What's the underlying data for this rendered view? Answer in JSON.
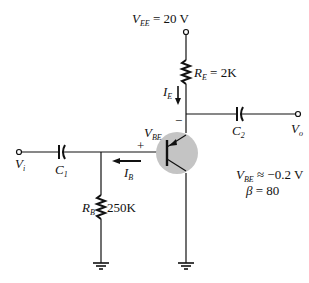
{
  "circuit": {
    "supply": {
      "symbol": "V",
      "sub": "EE",
      "value": "= 20 V"
    },
    "re": {
      "symbol": "R",
      "sub": "E",
      "value": "= 2K"
    },
    "ie": {
      "symbol": "I",
      "sub": "E"
    },
    "minus": "−",
    "plus": "+",
    "vbe_label": {
      "symbol": "V",
      "sub": "BE"
    },
    "c2": {
      "symbol": "C",
      "sub": "2"
    },
    "vo": {
      "symbol": "V",
      "sub": "o"
    },
    "vi": {
      "symbol": "V",
      "sub": "i"
    },
    "c1": {
      "symbol": "C",
      "sub": "1"
    },
    "ib": {
      "symbol": "I",
      "sub": "B"
    },
    "rb": {
      "symbol": "R",
      "sub": "B",
      "value": "250K"
    },
    "params": {
      "vbe": {
        "symbol": "V",
        "sub": "BE",
        "value": "≈ −0.2 V"
      },
      "beta": {
        "symbol": "β",
        "value": "= 80"
      }
    },
    "transistor_fill": "#c4c4c4",
    "line_color": "#111111"
  }
}
